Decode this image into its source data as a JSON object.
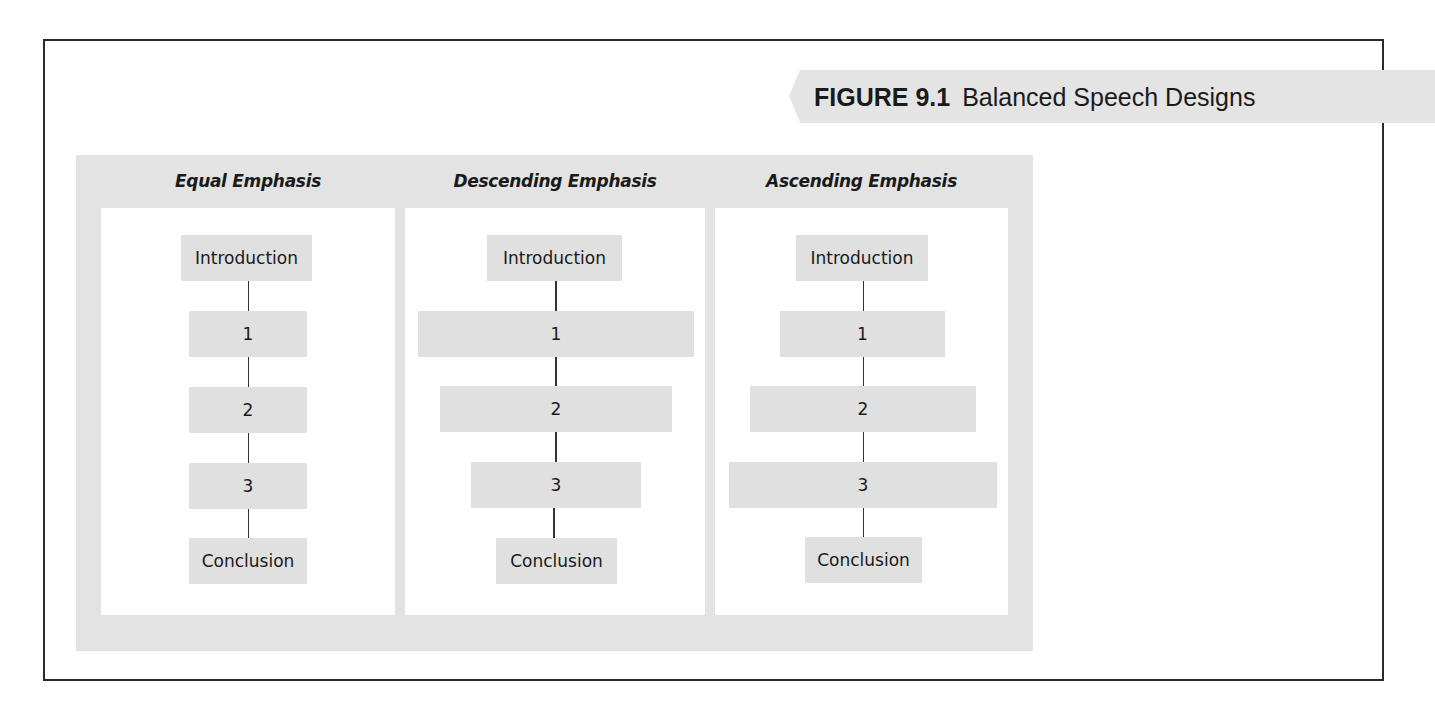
{
  "figure": {
    "label": "FIGURE 9.1",
    "title": "Balanced Speech Designs"
  },
  "columns": [
    {
      "heading": "Equal Emphasis",
      "boxes": [
        "Introduction",
        "1",
        "2",
        "3",
        "Conclusion"
      ]
    },
    {
      "heading": "Descending Emphasis",
      "boxes": [
        "Introduction",
        "1",
        "2",
        "3",
        "Conclusion"
      ]
    },
    {
      "heading": "Ascending Emphasis",
      "boxes": [
        "Introduction",
        "1",
        "2",
        "3",
        "Conclusion"
      ]
    }
  ],
  "colors": {
    "panel_gray": "#e3e3e3",
    "box_gray": "#e0e0e0",
    "frame": "#2b2b2b",
    "connector": "#333333"
  }
}
